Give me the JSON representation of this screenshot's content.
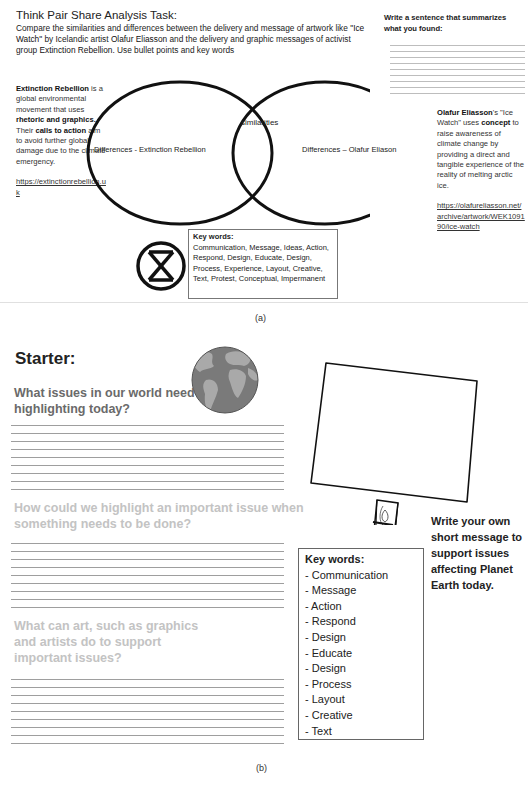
{
  "panel_a": {
    "task_title": "Think Pair Share Analysis Task:",
    "task_body": {
      "part1": "Compare the similarities and differences between the delivery and message of artwork like ",
      "artwork": "\"Ice Watch\"",
      "part2": " by Icelandic artist ",
      "artist": "Olafur Eliasson",
      "part3": " and the delivery and graphic messages of activist group ",
      "group": "Extinction Rebellion",
      "part4": ". Use bullet points and key words"
    },
    "summary": {
      "title": "Write a sentence that summarizes what you found:",
      "line_count": 9
    },
    "extinction_rebellion": {
      "name": "Extinction Rebellion",
      "t1": " is a global environmental movement that uses ",
      "b1": "rhetoric and graphics.",
      "t2": " Their ",
      "b2": "calls to action",
      "t3": " aim to avoid further global damage due to the climate emergency.",
      "url": "https://extinctionrebellion.uk"
    },
    "olafur": {
      "name": "Olafur Eliasson",
      "t1": "'s \"Ice Watch\" uses ",
      "b1": "concept",
      "t2": " to raise awareness of climate change by providing a direct and tangible experience of the reality of melting arctic ice.",
      "url": "https://olafureliasson.net/archive/artwork/WEK109190/ice-watch"
    },
    "venn": {
      "left_label": "Differences - Extinction Rebellion",
      "middle_label": "similarities",
      "right_label": "Differences – Olafur Eliason"
    },
    "key_words": {
      "heading": "Key words:",
      "text": "Communication, Message, Ideas, Action, Respond, Design, Educate, Design, Process, Experience, Layout, Creative, Text, Protest, Conceptual, Impermanent"
    },
    "logo_icon": "extinction-symbol-icon",
    "caption": "(a)"
  },
  "panel_b": {
    "starter": "Starter:",
    "questions": [
      {
        "text": "What issues in our world need highlighting today?",
        "line_count": 9
      },
      {
        "text": "How could we highlight an important issue when something needs to be done?",
        "line_count": 9
      },
      {
        "text": "What can art, such as graphics and artists do to support important issues?",
        "line_count": 9
      }
    ],
    "globe_icon": "globe-icon",
    "sign_icon": "blank-protest-sign",
    "write_message": "Write your own short message to support issues affecting Planet Earth today.",
    "key_words": {
      "heading": "Key words:",
      "items": [
        "- Communication",
        "- Message",
        "- Action",
        "- Respond",
        "- Design",
        "- Educate",
        "- Design",
        "- Process",
        "- Layout",
        "- Creative",
        "- Text"
      ]
    },
    "caption": "(b)"
  },
  "colors": {
    "text": "#222222",
    "question_dark": "#6a6a6a",
    "question_faded": "#c3c3c3",
    "rule_line": "#9e9e9e"
  }
}
